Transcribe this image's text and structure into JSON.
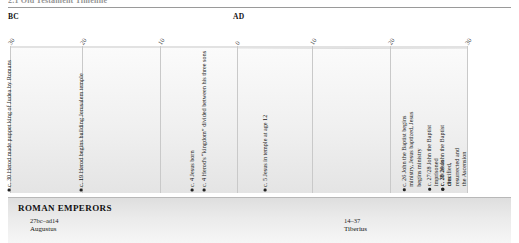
{
  "running_head": "2.1  Old Testament Timeline",
  "axis": {
    "era_left_label": "BC",
    "era_right_label": "AD",
    "tick_labels": [
      "30",
      "20",
      "10",
      "0",
      "10",
      "20",
      "30"
    ],
    "tick_positions_px": [
      10,
      82,
      160,
      237,
      312,
      390,
      467
    ]
  },
  "events": [
    {
      "text": "c. 30 Herod made puppet king of Judea by Romans",
      "x_px": 12
    },
    {
      "text": "c. 19 Herod begins building Jerusalem temple",
      "x_px": 84
    },
    {
      "text": "c. 4 Jesus born",
      "x_px": 195
    },
    {
      "text": "c. 4 Herod's “kingdom” divided between his three sons",
      "x_px": 207
    },
    {
      "text": "c. 5 Jesus in temple at age 12",
      "x_px": 268
    },
    {
      "text": "c. 26 John the Baptist begins ministry, Jesus baptized, Jesus begins ministry",
      "x_px": 422
    },
    {
      "text": "c. 27/28 John the Baptist imprisoned",
      "x_px": 440
    },
    {
      "text": "c. 28/29 John the Baptist dies",
      "x_px": 453
    },
    {
      "text": "c. 30 Jesus crucified, resurrected and the Ascension",
      "x_px": 468
    }
  ],
  "emperors": {
    "title": "ROMAN EMPERORS",
    "reigns": [
      {
        "years": "27bc–ad14",
        "name": "Augustus",
        "x_px": 22
      },
      {
        "years": "14–37",
        "name": "Tiberius",
        "x_px": 336
      }
    ]
  }
}
